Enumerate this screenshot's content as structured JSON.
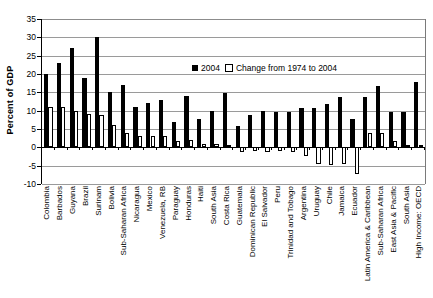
{
  "chart_data": {
    "type": "bar",
    "title": "",
    "xlabel": "",
    "ylabel": "Percent of GDP",
    "ylim": [
      -10,
      35
    ],
    "yticks": [
      35,
      30,
      25,
      20,
      15,
      10,
      5,
      0,
      -5,
      -10
    ],
    "grid": true,
    "legend_position": "inside-top-right",
    "categories": [
      "Colombia",
      "Barbados",
      "Guyana",
      "Brazil",
      "Surinam",
      "Bolivia",
      "Sub-Saharan Africa",
      "Nicaragua",
      "Mexico",
      "Venezuela, RB",
      "Paraguay",
      "Honduras",
      "Haiti",
      "South Asia",
      "Costa Rica",
      "Guatemala",
      "Dominican Republic",
      "El Salvador",
      "Peru",
      "Trinidad and Tobago",
      "Argentina",
      "Uruguay",
      "Chile",
      "Jamaica",
      "Ecuador",
      "Latin America & Caribbean",
      "Sub-Saharan Africa",
      "East Asia & Pacific",
      "South Asia",
      "High Income: OECD"
    ],
    "series": [
      {
        "name": "2004",
        "color": "#000000",
        "values": [
          20,
          23,
          27,
          19,
          30,
          15,
          17,
          11,
          12,
          13,
          6.8,
          14,
          7.8,
          9.8,
          14.8,
          5.8,
          8.8,
          9.8,
          9.7,
          9.7,
          10.7,
          10.6,
          11.8,
          13.8,
          7.7,
          13.7,
          16.7,
          9.7,
          9.6,
          17.7
        ]
      },
      {
        "name": "Change from 1974 to 2004",
        "color": "#ffffff",
        "values": [
          11,
          11,
          10,
          9,
          8.9,
          6,
          4,
          3,
          3,
          3,
          1.8,
          1.9,
          0.9,
          0.8,
          0.7,
          -1.3,
          -1.1,
          -1.4,
          -1.1,
          -1.2,
          -2.4,
          -4.5,
          -4.7,
          -4.6,
          -7.2,
          3.8,
          3.8,
          1.8,
          0.6,
          0.6
        ]
      }
    ]
  },
  "legend": {
    "entries": [
      {
        "label": "2004",
        "marker": "filled-square"
      },
      {
        "label": "Change from 1974 to 2004",
        "marker": "open-square"
      }
    ]
  }
}
